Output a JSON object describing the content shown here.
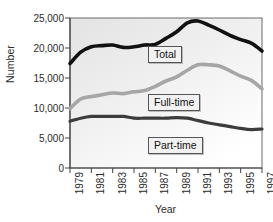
{
  "chart_data": {
    "type": "line",
    "title": "",
    "xlabel": "Year",
    "ylabel": "Number",
    "xlim": [
      1979,
      1997
    ],
    "ylim": [
      0,
      25000
    ],
    "grid": false,
    "legend_position": "inline-labels",
    "x": [
      1979,
      1980,
      1981,
      1982,
      1983,
      1984,
      1985,
      1986,
      1987,
      1988,
      1989,
      1990,
      1991,
      1992,
      1993,
      1994,
      1995,
      1996,
      1997
    ],
    "xtick_labels": [
      "1979",
      "1981",
      "1983",
      "1985",
      "1987",
      "1989",
      "1991",
      "1993",
      "1995",
      "1997"
    ],
    "xtick_values": [
      1979,
      1981,
      1983,
      1985,
      1987,
      1989,
      1991,
      1993,
      1995,
      1997
    ],
    "ytick_labels": [
      "0",
      "5,000",
      "10,000",
      "15,000",
      "20,000",
      "25,000"
    ],
    "ytick_values": [
      0,
      5000,
      10000,
      15000,
      20000,
      25000
    ],
    "series": [
      {
        "name": "Total",
        "color": "#111111",
        "width": 3.6,
        "values": [
          17400,
          19300,
          20200,
          20400,
          20500,
          20100,
          20200,
          20500,
          20600,
          21600,
          22700,
          24200,
          24500,
          23800,
          23000,
          22100,
          21400,
          20800,
          19500
        ]
      },
      {
        "name": "Full-time",
        "color": "#a6a6a6",
        "width": 3.6,
        "values": [
          9900,
          11500,
          11900,
          12200,
          12500,
          12400,
          12700,
          12900,
          13600,
          14500,
          15200,
          16300,
          17200,
          17200,
          17000,
          16200,
          15300,
          14600,
          13200
        ]
      },
      {
        "name": "Part-time",
        "color": "#3c3c3c",
        "width": 3.2,
        "values": [
          7800,
          8300,
          8600,
          8600,
          8600,
          8600,
          8300,
          8300,
          8300,
          8300,
          8400,
          8300,
          7900,
          7500,
          7200,
          6900,
          6600,
          6400,
          6500
        ]
      }
    ],
    "annotations": [
      {
        "label": "Total",
        "name": "legend-total"
      },
      {
        "label": "Full-time",
        "name": "legend-full-time"
      },
      {
        "label": "Part-time",
        "name": "legend-part-time"
      }
    ]
  },
  "colors": {
    "total": "#111111",
    "full_time": "#a6a6a6",
    "part_time": "#3c3c3c",
    "axis": "#555555",
    "plot_bg_top": "#e4e4e4",
    "plot_bg_bottom": "#ffffff"
  }
}
